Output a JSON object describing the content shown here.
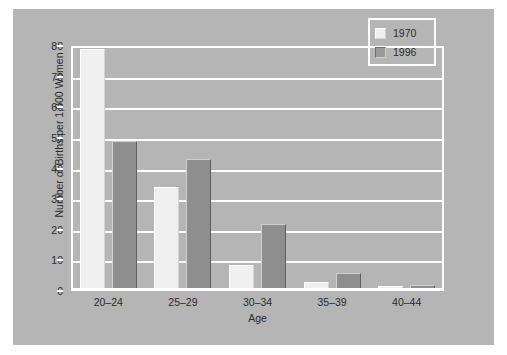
{
  "chart_data": {
    "type": "bar",
    "title": "",
    "subtitle": "",
    "xlabel": "Age",
    "ylabel": "Number of Births per 1,000 Women",
    "categories": [
      "20–24",
      "25–29",
      "30–34",
      "35–39",
      "40–44"
    ],
    "series": [
      {
        "name": "1970",
        "values": [
          78,
          33,
          7.5,
          2,
          0.5
        ],
        "color": "#f0f0f0"
      },
      {
        "name": "1996",
        "values": [
          48,
          42,
          21,
          5,
          1
        ],
        "color": "#8e8e8e"
      }
    ],
    "ylim": [
      0,
      80
    ],
    "ytick_values": [
      0,
      10,
      20,
      30,
      40,
      50,
      60,
      70,
      80
    ],
    "ytick_labels": [
      "0",
      "10",
      "20",
      "30",
      "40",
      "50",
      "60",
      "70",
      "80"
    ],
    "grid": true,
    "grid_color": "#ffffff",
    "legend_position": "top-right",
    "plot_background": "#b5b5b5",
    "figure_background": "#ffffff"
  },
  "legend": {
    "entries": [
      {
        "label": "1970",
        "swatch": "swatch-light"
      },
      {
        "label": "1996",
        "swatch": "swatch-dark"
      }
    ]
  }
}
